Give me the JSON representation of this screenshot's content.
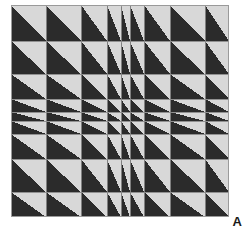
{
  "figure": {
    "panel_label": "A",
    "title": "",
    "caption": ""
  },
  "colors": {
    "triangle_fill": "#2b2b2b",
    "cell_background": "#d8d8d8",
    "grid_line": "#8a8a8a",
    "border": "#9a9a9a",
    "page_background": "#ffffff",
    "label_color": "#1a1a1a"
  },
  "chart_data": {
    "type": "heatmap",
    "title": "",
    "xlabel": "",
    "ylabel": "",
    "grid": true,
    "legend": "none",
    "rows": 9,
    "columns": 9,
    "plot_width_px": 218,
    "plot_height_px": 212,
    "column_widths_px": [
      35,
      35,
      26,
      14,
      9,
      14,
      26,
      35,
      24
    ],
    "row_heights_px": [
      36,
      33,
      25,
      13,
      9,
      13,
      25,
      33,
      25
    ],
    "triangle_orientation": "lower-left",
    "cells_total": 81,
    "x_tick_positions_px": [
      0,
      35,
      70,
      96,
      110,
      119,
      133,
      159,
      194,
      218
    ],
    "y_tick_positions_px": [
      0,
      36,
      69,
      94,
      107,
      116,
      129,
      154,
      187,
      212
    ],
    "xlim": [
      0,
      218
    ],
    "ylim": [
      0,
      212
    ]
  }
}
